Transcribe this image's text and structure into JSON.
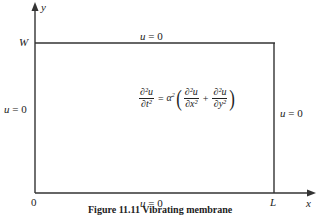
{
  "diagram": {
    "type": "boundary-value-region",
    "axes": {
      "x_label": "x",
      "y_label": "y",
      "origin_label": "0"
    },
    "tick_labels": {
      "top_left": "W",
      "bottom_right": "L"
    },
    "boundary_conditions": {
      "top": "u = 0",
      "bottom": "u = 0",
      "left": "u = 0",
      "right": "u = 0"
    },
    "equation": {
      "lhs_num": "∂²u",
      "lhs_den": "∂t²",
      "equals": "=",
      "coef": "α",
      "coef_exp": "2",
      "term1_num": "∂²u",
      "term1_den": "∂x²",
      "plus": "+",
      "term2_num": "∂²u",
      "term2_den": "∂y²",
      "open_paren": "(",
      "close_paren": ")"
    },
    "caption": "Figure 11.11 Vibrating membrane",
    "colors": {
      "line": "#333333",
      "text": "#222222",
      "background": "#ffffff"
    }
  }
}
